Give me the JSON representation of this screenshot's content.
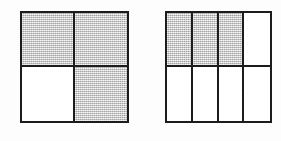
{
  "page": {
    "background_color": "#fdfdfd",
    "width": 281,
    "height": 141
  },
  "style": {
    "line_color": "#1c1c1c",
    "shaded_color": "#d2d2d2",
    "unshaded_color": "#ffffff",
    "line_width_px": 2
  },
  "figures": [
    {
      "id": "figure-halves-quarters",
      "name": "left-square-model",
      "shape": "square",
      "columns": 2,
      "rows": 2,
      "total_parts": 4,
      "shaded_parts": 3,
      "fraction": "3/4",
      "cells": [
        {
          "index": 0,
          "row": 1,
          "column": 1,
          "position": "top-left",
          "shaded": true
        },
        {
          "index": 1,
          "row": 1,
          "column": 2,
          "position": "top-right",
          "shaded": true
        },
        {
          "index": 2,
          "row": 2,
          "column": 1,
          "position": "bottom-left",
          "shaded": false
        },
        {
          "index": 3,
          "row": 2,
          "column": 2,
          "position": "bottom-right",
          "shaded": true
        }
      ]
    },
    {
      "id": "figure-eighths",
      "name": "right-square-model",
      "shape": "square",
      "columns": 4,
      "rows": 2,
      "total_parts": 8,
      "shaded_parts": 3,
      "fraction": "3/8",
      "cells": [
        {
          "index": 0,
          "row": 1,
          "column": 1,
          "position": "top-1",
          "shaded": true
        },
        {
          "index": 1,
          "row": 1,
          "column": 2,
          "position": "top-2",
          "shaded": true
        },
        {
          "index": 2,
          "row": 1,
          "column": 3,
          "position": "top-3",
          "shaded": true
        },
        {
          "index": 3,
          "row": 1,
          "column": 4,
          "position": "top-4",
          "shaded": false
        },
        {
          "index": 4,
          "row": 2,
          "column": 1,
          "position": "bottom-1",
          "shaded": false
        },
        {
          "index": 5,
          "row": 2,
          "column": 2,
          "position": "bottom-2",
          "shaded": false
        },
        {
          "index": 6,
          "row": 2,
          "column": 3,
          "position": "bottom-3",
          "shaded": false
        },
        {
          "index": 7,
          "row": 2,
          "column": 4,
          "position": "bottom-4",
          "shaded": false
        }
      ]
    }
  ],
  "chart_data": {
    "type": "bar",
    "title": "",
    "xlabel": "",
    "ylabel": "",
    "categories": [
      "Left square (quarters)",
      "Right square (eighths)"
    ],
    "series": [
      {
        "name": "Shaded parts",
        "values": [
          3,
          3
        ]
      },
      {
        "name": "Total parts",
        "values": [
          4,
          8
        ]
      }
    ],
    "annotations": [
      "3/4",
      "3/8"
    ]
  }
}
